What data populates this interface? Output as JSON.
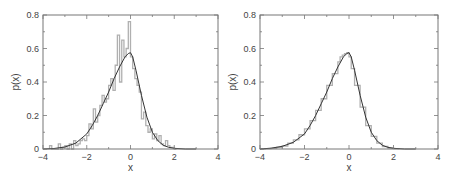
{
  "chart_data": [
    {
      "type": "line",
      "panel": "left",
      "title": "",
      "xlabel": "x",
      "ylabel": "p(x)",
      "xlim": [
        -4,
        4
      ],
      "ylim": [
        0,
        0.8
      ],
      "xticks": [
        "-4",
        "-2",
        "0",
        "2",
        "4"
      ],
      "xtick_values": [
        -4,
        -2,
        0,
        2,
        4
      ],
      "yticks": [
        "0",
        "0.2",
        "0.4",
        "0.6",
        "0.8"
      ],
      "ytick_values": [
        0,
        0.2,
        0.4,
        0.6,
        0.8
      ],
      "grid": false,
      "series": [
        {
          "name": "histogram",
          "kind": "step",
          "color": "#b0b0b0",
          "bin_edges": [
            -3.7,
            -3.6,
            -3.5,
            -3.4,
            -3.3,
            -3.2,
            -3.1,
            -3.0,
            -2.9,
            -2.8,
            -2.7,
            -2.6,
            -2.5,
            -2.4,
            -2.3,
            -2.2,
            -2.1,
            -2.0,
            -1.9,
            -1.8,
            -1.7,
            -1.6,
            -1.5,
            -1.4,
            -1.3,
            -1.2,
            -1.1,
            -1.0,
            -0.9,
            -0.8,
            -0.7,
            -0.6,
            -0.5,
            -0.4,
            -0.3,
            -0.2,
            -0.1,
            0.0,
            0.1,
            0.2,
            0.3,
            0.4,
            0.5,
            0.6,
            0.7,
            0.8,
            0.9,
            1.0,
            1.1,
            1.2,
            1.3,
            1.4,
            1.5,
            1.6,
            1.7,
            1.8,
            1.9,
            2.0,
            2.1
          ],
          "values": [
            0.02,
            0,
            0,
            0,
            0.03,
            0,
            0.01,
            0.02,
            0,
            0.03,
            0,
            0.05,
            0.02,
            0.03,
            0.05,
            0.06,
            0.05,
            0.08,
            0.15,
            0.12,
            0.24,
            0.16,
            0.2,
            0.26,
            0.32,
            0.28,
            0.3,
            0.38,
            0.42,
            0.35,
            0.5,
            0.68,
            0.4,
            0.65,
            0.55,
            0.6,
            0.76,
            0.55,
            0.48,
            0.42,
            0.38,
            0.34,
            0.18,
            0.22,
            0.14,
            0.1,
            0.12,
            0.06,
            0.09,
            0.05,
            0.08,
            0.03,
            0.02,
            0.05,
            0.02,
            0.01,
            0.01,
            0
          ]
        },
        {
          "name": "fit",
          "kind": "curve",
          "color": "#333333",
          "x": [
            -4,
            -3.5,
            -3,
            -2.5,
            -2,
            -1.75,
            -1.5,
            -1.25,
            -1,
            -0.75,
            -0.5,
            -0.25,
            -0.1,
            0,
            0.1,
            0.25,
            0.5,
            0.75,
            1,
            1.25,
            1.5,
            1.75,
            2,
            2.5,
            3
          ],
          "y": [
            0.0,
            0.003,
            0.012,
            0.035,
            0.09,
            0.14,
            0.2,
            0.27,
            0.34,
            0.42,
            0.49,
            0.55,
            0.57,
            0.575,
            0.55,
            0.47,
            0.32,
            0.19,
            0.1,
            0.05,
            0.022,
            0.01,
            0.004,
            0.0,
            0.0
          ]
        }
      ]
    },
    {
      "type": "line",
      "panel": "right",
      "title": "",
      "xlabel": "x",
      "ylabel": "p(x)",
      "xlim": [
        -4,
        4
      ],
      "ylim": [
        0,
        0.8
      ],
      "xticks": [
        "-4",
        "-2",
        "0",
        "2",
        "4"
      ],
      "xtick_values": [
        -4,
        -2,
        0,
        2,
        4
      ],
      "yticks": [
        "0",
        "0.2",
        "0.4",
        "0.6",
        "0.8"
      ],
      "ytick_values": [
        0,
        0.2,
        0.4,
        0.6,
        0.8
      ],
      "grid": false,
      "series": [
        {
          "name": "histogram",
          "kind": "step",
          "color": "#b0b0b0",
          "bin_edges": [
            -4,
            -3.75,
            -3.5,
            -3.25,
            -3,
            -2.75,
            -2.5,
            -2.25,
            -2,
            -1.75,
            -1.5,
            -1.25,
            -1,
            -0.75,
            -0.5,
            -0.4,
            -0.3,
            -0.2,
            -0.1,
            0,
            0.1,
            0.25,
            0.5,
            0.75,
            1,
            1.25,
            1.5,
            1.75,
            2,
            2.25
          ],
          "values": [
            0.001,
            0.002,
            0.004,
            0.01,
            0.018,
            0.035,
            0.055,
            0.085,
            0.12,
            0.17,
            0.23,
            0.3,
            0.38,
            0.45,
            0.52,
            0.55,
            0.56,
            0.57,
            0.575,
            0.55,
            0.48,
            0.38,
            0.25,
            0.14,
            0.075,
            0.035,
            0.015,
            0.006,
            0.002
          ]
        },
        {
          "name": "fit",
          "kind": "curve",
          "color": "#333333",
          "x": [
            -4,
            -3.5,
            -3,
            -2.5,
            -2,
            -1.75,
            -1.5,
            -1.25,
            -1,
            -0.75,
            -0.5,
            -0.25,
            -0.1,
            0,
            0.1,
            0.25,
            0.5,
            0.75,
            1,
            1.25,
            1.5,
            1.75,
            2,
            2.5,
            3
          ],
          "y": [
            0.0,
            0.005,
            0.016,
            0.04,
            0.09,
            0.14,
            0.2,
            0.27,
            0.34,
            0.42,
            0.49,
            0.55,
            0.57,
            0.575,
            0.55,
            0.47,
            0.32,
            0.19,
            0.1,
            0.05,
            0.022,
            0.01,
            0.004,
            0.0,
            0.0
          ]
        }
      ]
    }
  ]
}
